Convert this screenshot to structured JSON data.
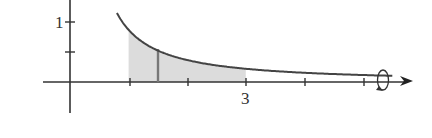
{
  "figure": {
    "type": "solid-of-revolution-diagram",
    "y_axis": {
      "tick_labels": [
        {
          "value": 1,
          "label": "1"
        }
      ]
    },
    "x_axis": {
      "tick_labels": [
        {
          "value": 3,
          "label": "3"
        }
      ]
    },
    "shaded_region": {
      "from_x": 1,
      "to_x": 3
    },
    "strip_x": 1.5,
    "rotation_symbol": "revolve-about-x-axis",
    "colors": {
      "axis": "#333333",
      "curve": "#444444",
      "shade": "#dcdcdc",
      "strip": "#777777"
    }
  }
}
